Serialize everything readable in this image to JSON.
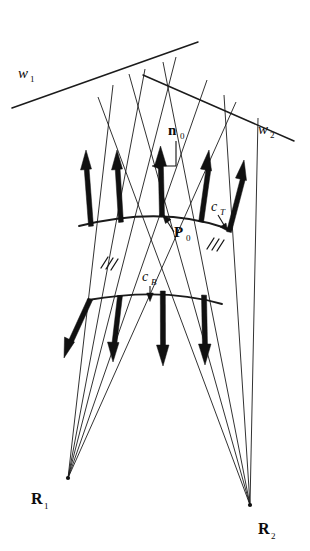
{
  "figure": {
    "background_color": "#ffffff",
    "ink_color": "#111111",
    "width": 310,
    "height": 551
  },
  "labels": {
    "w1": {
      "base": "w",
      "sub": "1",
      "style": "italic",
      "x": 18,
      "y": 78
    },
    "w2": {
      "base": "w",
      "sub": "2",
      "style": "italic",
      "x": 258,
      "y": 134
    },
    "n0": {
      "base": "n",
      "sub": "0",
      "style": "bold",
      "x": 170,
      "y": 135
    },
    "P0": {
      "base": "P",
      "sub": "0",
      "style": "bold",
      "x": 172,
      "y": 236
    },
    "cT": {
      "base": "c",
      "sub": "T",
      "style": "italic",
      "x": 212,
      "y": 211
    },
    "cB": {
      "base": "c",
      "sub": "B",
      "style": "italic",
      "x": 143,
      "y": 281
    },
    "R1": {
      "base": "R",
      "sub": "1",
      "style": "bold",
      "x": 31,
      "y": 504
    },
    "R2": {
      "base": "R",
      "sub": "2",
      "style": "bold",
      "x": 258,
      "y": 534
    }
  },
  "points": {
    "R1": {
      "x": 68,
      "y": 478,
      "name": "radiant-point-1"
    },
    "R2": {
      "x": 250,
      "y": 505,
      "name": "radiant-point-2"
    },
    "P0": {
      "x": 163,
      "y": 216,
      "name": "surface-point-P0"
    }
  },
  "wavefronts": [
    {
      "id": "w1",
      "x1": 12,
      "y1": 108,
      "x2": 198,
      "y2": 42
    },
    {
      "id": "w2",
      "x1": 143,
      "y1": 75,
      "x2": 294,
      "y2": 141
    }
  ],
  "curves": {
    "cT": {
      "id": "cT",
      "path": "M 79 226 Q 163 205 229 229",
      "name": "top-curve-cT"
    },
    "cB": {
      "id": "cB",
      "path": "M 88 300 Q 163 287 222 304",
      "name": "bottom-curve-cB"
    }
  },
  "rays_from_R1": [
    {
      "x1": 68,
      "y1": 478,
      "x2": 113,
      "y2": 85
    },
    {
      "x1": 68,
      "y1": 478,
      "x2": 145,
      "y2": 69
    },
    {
      "x1": 68,
      "y1": 478,
      "x2": 176,
      "y2": 57
    },
    {
      "x1": 68,
      "y1": 478,
      "x2": 207,
      "y2": 80
    },
    {
      "x1": 68,
      "y1": 478,
      "x2": 236,
      "y2": 102
    }
  ],
  "rays_from_R2": [
    {
      "x1": 250,
      "y1": 505,
      "x2": 98,
      "y2": 97
    },
    {
      "x1": 250,
      "y1": 505,
      "x2": 129,
      "y2": 74
    },
    {
      "x1": 250,
      "y1": 505,
      "x2": 163,
      "y2": 62
    },
    {
      "x1": 250,
      "y1": 505,
      "x2": 224,
      "y2": 95
    },
    {
      "x1": 250,
      "y1": 505,
      "x2": 258,
      "y2": 118
    }
  ],
  "up_arrows": [
    {
      "x1": 91,
      "y1": 226,
      "x2": 86,
      "y2": 152,
      "name": "normal-arrow-1"
    },
    {
      "x1": 121,
      "y1": 222,
      "x2": 117,
      "y2": 152,
      "name": "normal-arrow-2"
    },
    {
      "x1": 162,
      "y1": 216,
      "x2": 160,
      "y2": 148,
      "name": "normal-arrow-3"
    },
    {
      "x1": 201,
      "y1": 221,
      "x2": 208,
      "y2": 152,
      "name": "normal-arrow-4"
    },
    {
      "x1": 229,
      "y1": 231,
      "x2": 243,
      "y2": 162,
      "name": "normal-arrow-5"
    }
  ],
  "down_arrows": [
    {
      "x1": 90,
      "y1": 299,
      "x2": 66,
      "y2": 357,
      "name": "reflected-arrow-1"
    },
    {
      "x1": 120,
      "y1": 296,
      "x2": 113,
      "y2": 360,
      "name": "reflected-arrow-2"
    },
    {
      "x1": 163,
      "y1": 291,
      "x2": 163,
      "y2": 364,
      "name": "reflected-arrow-3"
    },
    {
      "x1": 204,
      "y1": 295,
      "x2": 205,
      "y2": 363,
      "name": "reflected-arrow-4"
    }
  ],
  "hatch_marks": [
    {
      "x": 106,
      "y": 262,
      "name": "equal-angle-hatch-left"
    },
    {
      "x": 213,
      "y": 243,
      "name": "equal-angle-hatch-right"
    }
  ],
  "leaders": {
    "n0": {
      "path": "M 176 141 L 176 166 L 158 166",
      "tip": {
        "x": 153,
        "y": 166
      },
      "dir": "left"
    },
    "P0": {
      "path": "M 173 231 L 165 219",
      "tip": {
        "x": 162,
        "y": 215
      },
      "dir": "up-left"
    },
    "cT": {
      "path": "M 219 214 L 224 225",
      "tip": {
        "x": 226,
        "y": 229
      },
      "dir": "down-right"
    },
    "cB": {
      "path": "M 150 285 L 150 296",
      "tip": {
        "x": 150,
        "y": 300
      },
      "dir": "down"
    }
  }
}
